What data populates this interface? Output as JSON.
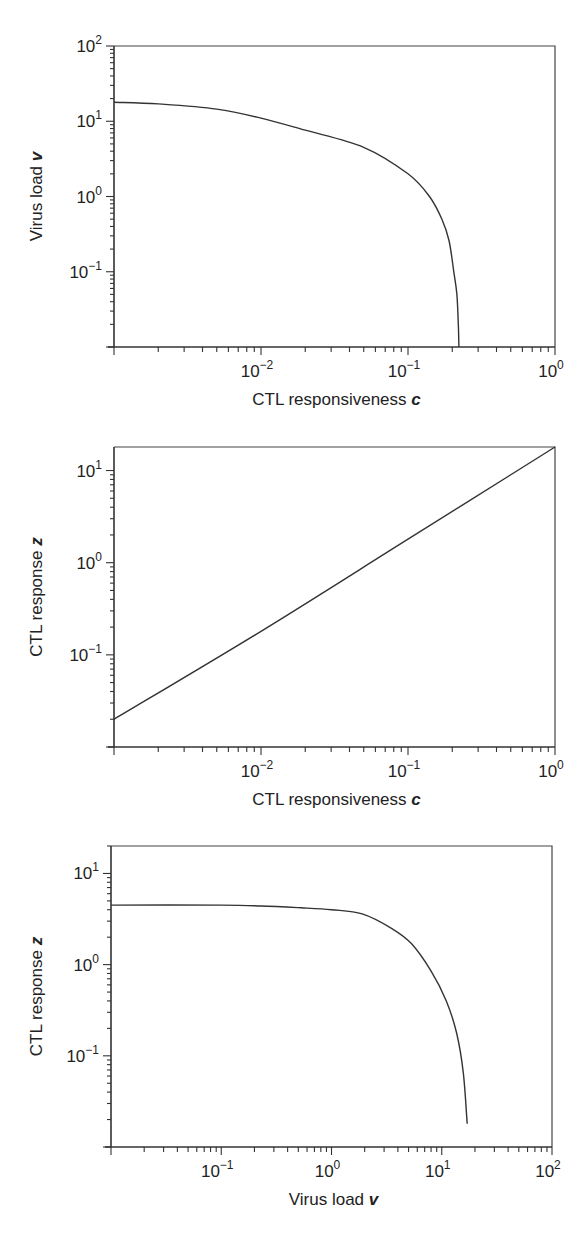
{
  "chart_data": [
    {
      "type": "line",
      "title": "",
      "xlabel": "CTL responsiveness c",
      "ylabel": "Virus load v",
      "xlabel_text": "CTL responsiveness ",
      "xlabel_var": "c",
      "ylabel_text": "Virus load ",
      "ylabel_var": "v",
      "xscale": "log",
      "yscale": "log",
      "xlim": [
        0.001,
        1
      ],
      "ylim": [
        0.01,
        100
      ],
      "xticks": [
        {
          "base": "10",
          "exp": "−2",
          "value": 0.01
        },
        {
          "base": "10",
          "exp": "−1",
          "value": 0.1
        },
        {
          "base": "10",
          "exp": "0",
          "value": 1
        }
      ],
      "yticks": [
        {
          "base": "10",
          "exp": "2",
          "value": 100
        },
        {
          "base": "10",
          "exp": "1",
          "value": 10
        },
        {
          "base": "10",
          "exp": "0",
          "value": 1
        },
        {
          "base": "10",
          "exp": "−1",
          "value": 0.1
        }
      ],
      "grid": false,
      "legend": null,
      "series": [
        {
          "name": "v vs c",
          "x": [
            0.001,
            0.002,
            0.005,
            0.01,
            0.02,
            0.05,
            0.1,
            0.14,
            0.17,
            0.19,
            0.205,
            0.215,
            0.22,
            0.222
          ],
          "y": [
            17.9,
            17,
            14.5,
            11,
            7.6,
            4.5,
            2.0,
            1.0,
            0.5,
            0.26,
            0.1,
            0.05,
            0.02,
            0.01
          ]
        }
      ]
    },
    {
      "type": "line",
      "title": "",
      "xlabel": "CTL responsiveness c",
      "ylabel": "CTL response z",
      "xlabel_text": "CTL responsiveness ",
      "xlabel_var": "c",
      "ylabel_text": "CTL response ",
      "ylabel_var": "z",
      "xscale": "log",
      "yscale": "log",
      "xlim": [
        0.001,
        1
      ],
      "ylim": [
        0.01,
        18
      ],
      "xticks": [
        {
          "base": "10",
          "exp": "−2",
          "value": 0.01
        },
        {
          "base": "10",
          "exp": "−1",
          "value": 0.1
        },
        {
          "base": "10",
          "exp": "0",
          "value": 1
        }
      ],
      "yticks": [
        {
          "base": "10",
          "exp": "1",
          "value": 10
        },
        {
          "base": "10",
          "exp": "0",
          "value": 1
        },
        {
          "base": "10",
          "exp": "−1",
          "value": 0.1
        }
      ],
      "grid": false,
      "legend": null,
      "series": [
        {
          "name": "z vs c",
          "x": [
            0.001,
            0.01,
            0.1,
            1
          ],
          "y": [
            0.02,
            0.18,
            1.8,
            18
          ]
        }
      ]
    },
    {
      "type": "line",
      "title": "",
      "xlabel": "Virus load v",
      "ylabel": "CTL response z",
      "xlabel_text": "Virus load ",
      "xlabel_var": "v",
      "ylabel_text": "CTL response ",
      "ylabel_var": "z",
      "xscale": "log",
      "yscale": "log",
      "xlim": [
        0.01,
        100
      ],
      "ylim": [
        0.01,
        20
      ],
      "xticks": [
        {
          "base": "10",
          "exp": "−1",
          "value": 0.1
        },
        {
          "base": "10",
          "exp": "0",
          "value": 1
        },
        {
          "base": "10",
          "exp": "1",
          "value": 10
        },
        {
          "base": "10",
          "exp": "2",
          "value": 100
        }
      ],
      "yticks": [
        {
          "base": "10",
          "exp": "1",
          "value": 10
        },
        {
          "base": "10",
          "exp": "0",
          "value": 1
        },
        {
          "base": "10",
          "exp": "−1",
          "value": 0.1
        }
      ],
      "grid": false,
      "legend": null,
      "series": [
        {
          "name": "z vs v",
          "x": [
            0.01,
            0.1,
            0.23,
            0.53,
            1.0,
            1.9,
            3.5,
            5.3,
            8.0,
            11,
            13.6,
            15.7,
            17.0
          ],
          "y": [
            4.5,
            4.5,
            4.4,
            4.2,
            4.0,
            3.6,
            2.5,
            1.7,
            0.85,
            0.4,
            0.18,
            0.065,
            0.018
          ]
        }
      ]
    }
  ],
  "layout": [
    {
      "plot": {
        "left": 114,
        "top": 46,
        "right": 555,
        "bottom": 347
      },
      "ylabel_x": 42
    },
    {
      "plot": {
        "left": 114,
        "top": 447,
        "right": 555,
        "bottom": 747
      },
      "ylabel_x": 42
    },
    {
      "plot": {
        "left": 111,
        "top": 846,
        "right": 552,
        "bottom": 1147
      },
      "ylabel_x": 42
    }
  ]
}
